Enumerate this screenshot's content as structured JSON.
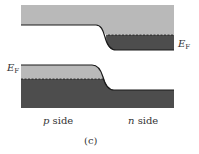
{
  "figure": {
    "caption": "(c)",
    "colors": {
      "light_band": "#b9b9b9",
      "dark_band": "#4d4d4d",
      "edge_line": "#1a1a1a",
      "background": "#ffffff"
    },
    "top_band": {
      "fermi_label_main": "E",
      "fermi_label_sub": "F"
    },
    "bottom_band": {
      "fermi_label_main": "E",
      "fermi_label_sub": "F"
    },
    "x_labels": {
      "p_letter": "p",
      "p_word": " side",
      "n_letter": "n",
      "n_word": " side"
    }
  }
}
